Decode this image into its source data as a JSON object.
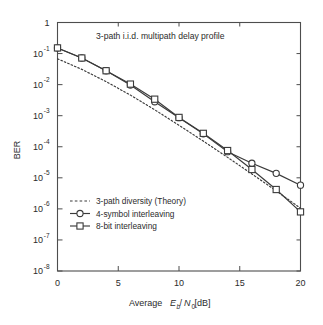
{
  "chart_data": {
    "type": "line",
    "title": "3-path i.i.d. multipath delay profile",
    "xlabel_parts": {
      "prefix": "Average ",
      "e": "E",
      "e_sub": "b",
      "slash": "/",
      "n": "N",
      "n_sub": "0",
      "unit": " [dB]"
    },
    "xlabel": "Average Eb/N0 [dB]",
    "ylabel": "BER",
    "xlim": [
      0,
      20
    ],
    "ylim": [
      1e-08,
      1
    ],
    "yscale": "log",
    "grid": false,
    "legend_position": "lower-left-inside",
    "xticks": [
      0,
      5,
      10,
      15,
      20
    ],
    "xtick_labels": [
      "0",
      "5",
      "10",
      "15",
      "20"
    ],
    "yticks": [
      1,
      0.1,
      0.01,
      0.001,
      0.0001,
      1e-05,
      1e-06,
      1e-07,
      1e-08
    ],
    "ytick_labels": [
      "1",
      "10⁻¹",
      "10⁻²",
      "10⁻³",
      "10⁻⁴",
      "10⁻⁵",
      "10⁻⁶",
      "10⁻⁷",
      "10⁻⁸"
    ],
    "ytick_mantissa": [
      "1",
      "10",
      "10",
      "10",
      "10",
      "10",
      "10",
      "10",
      "10"
    ],
    "ytick_exponent": [
      "",
      "-1",
      "-2",
      "-3",
      "-4",
      "-5",
      "-6",
      "-7",
      "-8"
    ],
    "series": [
      {
        "name": "3-path diversity (Theory)",
        "style": "dashed",
        "marker": "none",
        "x": [
          0,
          2,
          4,
          6,
          8,
          10,
          12,
          14,
          16,
          18,
          20
        ],
        "y": [
          0.068,
          0.031,
          0.0125,
          0.0046,
          0.00155,
          0.00049,
          0.000152,
          4.55e-05,
          1.33e-05,
          3.8e-06,
          1.05e-06
        ]
      },
      {
        "name": "4-symbol interleaving",
        "style": "solid",
        "marker": "circle",
        "x": [
          0,
          2,
          4,
          6,
          8,
          10,
          12,
          14,
          16,
          18,
          20
        ],
        "y": [
          0.152,
          0.072,
          0.028,
          0.0097,
          0.0028,
          0.00086,
          0.00026,
          6.95e-05,
          2.95e-05,
          1.39e-05,
          5.8e-06
        ]
      },
      {
        "name": "8-bit interleaving",
        "style": "solid",
        "marker": "square",
        "x": [
          0,
          2,
          4,
          6,
          8,
          10,
          12,
          14,
          16,
          18,
          20
        ],
        "y": [
          0.152,
          0.072,
          0.028,
          0.0104,
          0.0034,
          0.00088,
          0.00027,
          7.55e-05,
          1.85e-05,
          4.2e-06,
          8e-07
        ]
      }
    ],
    "colors": {
      "line": "#3a3a3a",
      "frame": "#4d4d4d",
      "text": "#2b2b2b",
      "background": "#ffffff",
      "marker_fill": "#ffffff"
    }
  }
}
